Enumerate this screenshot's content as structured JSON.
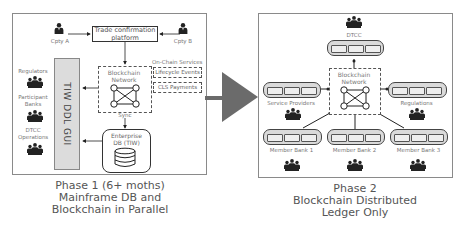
{
  "phase1": {
    "caption": [
      "Phase 1 (6+ moths)",
      "Mainframe DB and",
      "Blockchain in Parallel"
    ],
    "trade_platform": [
      "Trade confirmation",
      "platform"
    ],
    "cpty_a": "Cpty A",
    "cpty_b": "Cpty B",
    "blockchain_network": [
      "Blockchain",
      "Network"
    ],
    "on_chain_services": "On-Chain Services",
    "lifecycle_events": "Lifecycle Events",
    "cls_payments": "CLS Payments",
    "sync": "Sync",
    "enterprise_db": [
      "Enterprise",
      "DB (TIW)"
    ],
    "gui": "TIW DDL GUI",
    "regulators": "Regulators",
    "participant_banks": [
      "Participant",
      "Banks"
    ],
    "dtcc_operations": [
      "DTCC",
      "Operations"
    ]
  },
  "phase2": {
    "caption": [
      "Phase 2",
      "Blockchain Distributed",
      "Ledger Only"
    ],
    "dtcc": "DTCC",
    "blockchain_network": [
      "Blockchain",
      "Network"
    ],
    "service_providers": "Service Providers",
    "regulations": "Regulations",
    "member_bank_1": "Member Bank 1",
    "member_bank_2": "Member Bank 2",
    "member_bank_3": "Member Bank 3"
  },
  "colors": {
    "arrow": "#6b6b6b",
    "gui_fill": "#dcdcdc",
    "chain_fill": "#dadada",
    "border": "#8a8a8a"
  }
}
